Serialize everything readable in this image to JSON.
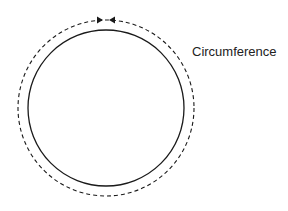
{
  "diagram": {
    "label": "Circumference",
    "colors": {
      "stroke": "#1a1a1a",
      "background": "#ffffff"
    },
    "shapes": {
      "circle": {
        "cx": 106,
        "cy": 108,
        "r": 78,
        "style": "solid"
      },
      "circumference_path": {
        "cx": 106,
        "cy": 108,
        "r": 88,
        "style": "dashed",
        "arrows": "converging at top"
      }
    }
  }
}
